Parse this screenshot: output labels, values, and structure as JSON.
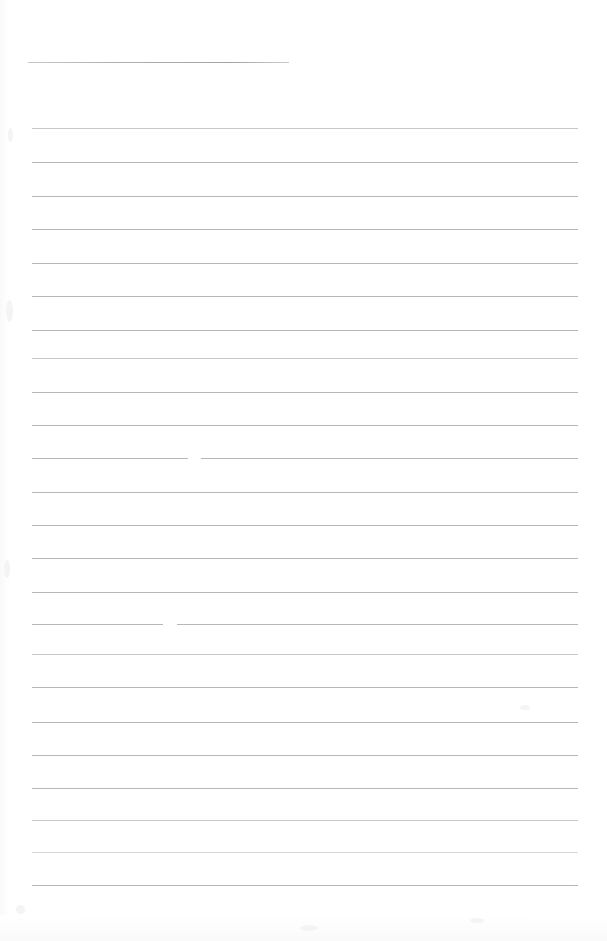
{
  "document": {
    "kind": "scanned-lined-paper",
    "title": "",
    "page_width": 607,
    "page_height": 941,
    "background_color": "#ffffff",
    "rule_color": "#b0b0b5",
    "handwriting": "",
    "visible_text": ""
  },
  "ruling": {
    "left_margin_x": 32,
    "right_margin_x": 578,
    "line_spacing": 33.4,
    "line_count": 25,
    "header_rule": {
      "x_start": 28,
      "x_end": 289,
      "y": 62,
      "length": 261
    },
    "lines": [
      {
        "index": 1,
        "y": 128,
        "x_start": 32,
        "x_end": 578,
        "weight": "faint"
      },
      {
        "index": 2,
        "y": 162,
        "x_start": 32,
        "x_end": 578,
        "weight": "normal"
      },
      {
        "index": 3,
        "y": 196,
        "x_start": 32,
        "x_end": 578,
        "weight": "normal"
      },
      {
        "index": 4,
        "y": 229,
        "x_start": 32,
        "x_end": 578,
        "weight": "normal"
      },
      {
        "index": 5,
        "y": 263,
        "x_start": 32,
        "x_end": 578,
        "weight": "normal"
      },
      {
        "index": 6,
        "y": 296,
        "x_start": 32,
        "x_end": 578,
        "weight": "normal"
      },
      {
        "index": 7,
        "y": 330,
        "x_start": 32,
        "x_end": 578,
        "weight": "normal"
      },
      {
        "index": 8,
        "y": 358,
        "x_start": 32,
        "x_end": 578,
        "weight": "faint"
      },
      {
        "index": 9,
        "y": 392,
        "x_start": 32,
        "x_end": 578,
        "weight": "normal"
      },
      {
        "index": 10,
        "y": 425,
        "x_start": 32,
        "x_end": 578,
        "weight": "normal"
      },
      {
        "index": 11,
        "y": 458,
        "x_start": 32,
        "x_end": 578,
        "weight": "normal",
        "gap": {
          "x": 188,
          "width": 13
        }
      },
      {
        "index": 12,
        "y": 492,
        "x_start": 32,
        "x_end": 578,
        "weight": "normal"
      },
      {
        "index": 13,
        "y": 525,
        "x_start": 32,
        "x_end": 578,
        "weight": "normal"
      },
      {
        "index": 14,
        "y": 558,
        "x_start": 32,
        "x_end": 578,
        "weight": "normal"
      },
      {
        "index": 15,
        "y": 592,
        "x_start": 32,
        "x_end": 578,
        "weight": "normal"
      },
      {
        "index": 16,
        "y": 624,
        "x_start": 32,
        "x_end": 578,
        "weight": "normal",
        "gap": {
          "x": 163,
          "width": 14
        }
      },
      {
        "index": 17,
        "y": 654,
        "x_start": 32,
        "x_end": 578,
        "weight": "faint"
      },
      {
        "index": 18,
        "y": 687,
        "x_start": 32,
        "x_end": 578,
        "weight": "normal"
      },
      {
        "index": 19,
        "y": 722,
        "x_start": 32,
        "x_end": 578,
        "weight": "normal"
      },
      {
        "index": 20,
        "y": 755,
        "x_start": 32,
        "x_end": 578,
        "weight": "normal"
      },
      {
        "index": 21,
        "y": 788,
        "x_start": 32,
        "x_end": 578,
        "weight": "normal"
      },
      {
        "index": 22,
        "y": 820,
        "x_start": 32,
        "x_end": 578,
        "weight": "faint"
      },
      {
        "index": 23,
        "y": 852,
        "x_start": 32,
        "x_end": 578,
        "weight": "fainter"
      },
      {
        "index": 24,
        "y": 885,
        "x_start": 32,
        "x_end": 578,
        "weight": "normal"
      }
    ]
  },
  "specks": [
    {
      "x": 6,
      "y": 300,
      "w": 7,
      "h": 22
    },
    {
      "x": 4,
      "y": 560,
      "w": 6,
      "h": 18
    },
    {
      "x": 8,
      "y": 128,
      "w": 5,
      "h": 14
    },
    {
      "x": 16,
      "y": 905,
      "w": 9,
      "h": 9
    },
    {
      "x": 300,
      "y": 925,
      "w": 18,
      "h": 6
    },
    {
      "x": 470,
      "y": 918,
      "w": 14,
      "h": 5
    },
    {
      "x": 520,
      "y": 705,
      "w": 10,
      "h": 5
    }
  ]
}
